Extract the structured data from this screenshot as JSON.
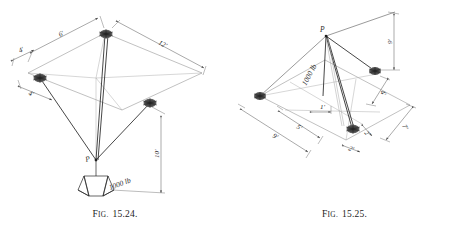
{
  "page": {
    "background_color": "#ffffff",
    "ink_color": "#2b2b2b",
    "line_color": "#555555",
    "anchor_color": "#3a3a3a"
  },
  "figures": [
    {
      "id": "fig-15-24",
      "caption_prefix": "Fig.",
      "caption_prefix_head": "F",
      "caption_prefix_tail": "IG.",
      "caption_number": "15.24.",
      "point_label": "P",
      "load_label": "1000 lb",
      "dimensions": [
        {
          "name": "top-left-run",
          "value": "6'"
        },
        {
          "name": "upper-offset",
          "value": "4'"
        },
        {
          "name": "lower-offset",
          "value": "4'"
        },
        {
          "name": "top-right-run",
          "value": "12'"
        },
        {
          "name": "drop-height",
          "value": "10'"
        }
      ]
    },
    {
      "id": "fig-15-25",
      "caption_prefix": "Fig.",
      "caption_prefix_head": "F",
      "caption_prefix_tail": "IG.",
      "caption_number": "15.25.",
      "point_label": "P",
      "load_label": "1000 lb",
      "dimensions": [
        {
          "name": "vertical-height",
          "value": "9'"
        },
        {
          "name": "left-run",
          "value": "9'"
        },
        {
          "name": "mid-run",
          "value": "5'"
        },
        {
          "name": "right-depth",
          "value": "4'"
        },
        {
          "name": "far-right-run",
          "value": "7'"
        },
        {
          "name": "small-offset-a",
          "value": "2'"
        },
        {
          "name": "small-offset-b",
          "value": "2'"
        },
        {
          "name": "small-offset-c",
          "value": "1'"
        }
      ]
    }
  ]
}
